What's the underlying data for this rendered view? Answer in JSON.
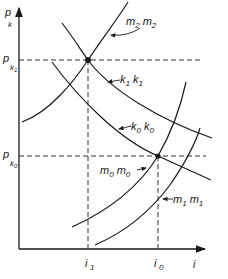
{
  "diagram": {
    "axes": {
      "y_label": "p",
      "y_label_sub": "k",
      "x_label": "i"
    },
    "y_ticks": [
      {
        "label": "p",
        "sub": "k1"
      },
      {
        "label": "p",
        "sub": "k0"
      }
    ],
    "x_ticks": [
      {
        "label": "i",
        "sub": "1"
      },
      {
        "label": "i",
        "sub": "0"
      }
    ],
    "curves": [
      {
        "id": "m2",
        "label": "m",
        "sub": "2",
        "label2": "m",
        "sub2": "2",
        "kind": "upward-sloping"
      },
      {
        "id": "k1",
        "label": "k",
        "sub": "1",
        "label2": "k",
        "sub2": "1",
        "kind": "downward-sloping"
      },
      {
        "id": "k0",
        "label": "k",
        "sub": "0",
        "label2": "k",
        "sub2": "0",
        "kind": "downward-sloping"
      },
      {
        "id": "m0",
        "label": "m",
        "sub": "0",
        "label2": "m",
        "sub2": "0",
        "kind": "upward-sloping"
      },
      {
        "id": "m1",
        "label": "m",
        "sub": "1",
        "label2": "m",
        "sub2": "1",
        "kind": "upward-sloping"
      }
    ],
    "equilibria": [
      {
        "at": "(i1, pk1)",
        "curves": [
          "m2",
          "k1"
        ]
      },
      {
        "at": "(i0, pk0)",
        "curves": [
          "m0",
          "k0"
        ]
      }
    ]
  }
}
